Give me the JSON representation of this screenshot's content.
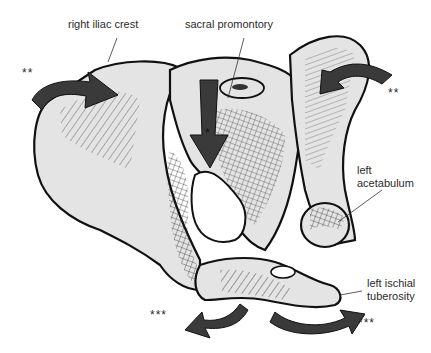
{
  "figure": {
    "labels": {
      "right_iliac_crest": "right iliac crest",
      "sacral_promontory": "sacral promontory",
      "left_acetabulum_line1": "left",
      "left_acetabulum_line2": "acetabulum",
      "left_ischial_line1": "left ischial",
      "left_ischial_line2": "tuberosity"
    },
    "markers": {
      "double_star": "**",
      "triple_star": "***",
      "single_star": "*"
    },
    "colors": {
      "bone_fill": "#e4e4e4",
      "outline": "#111111",
      "arrow_fill": "#3a3a3a",
      "label_text": "#2b2b2b"
    }
  }
}
